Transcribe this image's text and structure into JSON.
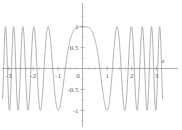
{
  "figure": {
    "title": "",
    "background_color": "#ffffff"
  },
  "chart_data": {
    "type": "line",
    "title": "",
    "subtitle": "",
    "xlabel": "z",
    "ylabel": "",
    "xlim": [
      -3.25,
      3.25
    ],
    "ylim": [
      -1.25,
      1.35
    ],
    "grid": false,
    "legend": null,
    "axis_color": "#9a9a9a",
    "curve_color": "#8f8f8f",
    "curve_width": 0.7,
    "x_ticks": [
      -3,
      -2,
      -1,
      0,
      1,
      2,
      3
    ],
    "x_tick_labels": [
      "-3",
      "-2",
      "-1",
      "0",
      "1",
      "2",
      "3"
    ],
    "y_ticks": [
      -1,
      -0.5,
      0.5,
      1
    ],
    "y_tick_labels": [
      "-1",
      "-0.5",
      "0.5",
      "1"
    ],
    "x_minor_ticks": [
      -2.75,
      -2.5,
      -2.25,
      -1.75,
      -1.5,
      -1.25,
      -0.75,
      -0.5,
      -0.25,
      0.25,
      0.5,
      0.75,
      1.25,
      1.5,
      1.75,
      2.25,
      2.5,
      2.75
    ],
    "y_minor_ticks": [
      -1.25,
      -0.75,
      -0.25,
      0.25,
      0.75,
      1.25
    ],
    "origin_label": "0",
    "series": [
      {
        "name": "curve",
        "description": "oscillating chirp with widest lobe at origin, frequency increasing with |z|",
        "x": [
          -3.25,
          -3.2,
          -3.15,
          -3.1,
          -3.05,
          -3.0,
          -2.95,
          -2.9,
          -2.85,
          -2.8,
          -2.75,
          -2.7,
          -2.65,
          -2.6,
          -2.55,
          -2.5,
          -2.45,
          -2.4,
          -2.35,
          -2.3,
          -2.25,
          -2.2,
          -2.15,
          -2.1,
          -2.05,
          -2.0,
          -1.95,
          -1.9,
          -1.85,
          -1.8,
          -1.75,
          -1.7,
          -1.65,
          -1.6,
          -1.55,
          -1.5,
          -1.45,
          -1.4,
          -1.35,
          -1.3,
          -1.25,
          -1.2,
          -1.15,
          -1.1,
          -1.05,
          -1.0,
          -0.95,
          -0.9,
          -0.85,
          -0.8,
          -0.75,
          -0.7,
          -0.65,
          -0.6,
          -0.55,
          -0.5,
          -0.45,
          -0.4,
          -0.35,
          -0.3,
          -0.25,
          -0.2,
          -0.15,
          -0.1,
          -0.05,
          0.0,
          0.05,
          0.1,
          0.15,
          0.2,
          0.25,
          0.3,
          0.35,
          0.4,
          0.45,
          0.5,
          0.55,
          0.6,
          0.65,
          0.7,
          0.75,
          0.8,
          0.85,
          0.9,
          0.95,
          1.0,
          1.05,
          1.1,
          1.15,
          1.2,
          1.25,
          1.3,
          1.35,
          1.4,
          1.45,
          1.5,
          1.55,
          1.6,
          1.65,
          1.7,
          1.75,
          1.8,
          1.85,
          1.9,
          1.95,
          2.0,
          2.05,
          2.1,
          2.15,
          2.2,
          2.25,
          2.3,
          2.35,
          2.4,
          2.45,
          2.5,
          2.55,
          2.6,
          2.65,
          2.7,
          2.75,
          2.8,
          2.85,
          2.9,
          2.95,
          3.0,
          3.05,
          3.1,
          3.15,
          3.2,
          3.25
        ],
        "formula": "cos(z^2 * 3.2)",
        "amplitude": 1.0,
        "peak_values": [
          1.0,
          1.0,
          1.0,
          1.0,
          1.0,
          1.0,
          1.0,
          1.0,
          1.0
        ],
        "trough_values": [
          -1.0,
          -1.0,
          -1.0,
          -1.0,
          -1.0,
          -1.0,
          -1.0,
          -1.0
        ]
      }
    ]
  }
}
